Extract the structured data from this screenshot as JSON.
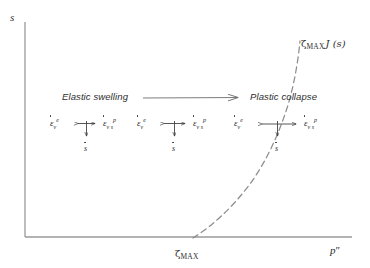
{
  "figure": {
    "type": "schematic-diagram",
    "background_color": "#ffffff",
    "ink_color": "#2e2e2e"
  },
  "axes": {
    "y_label": "s",
    "x_label": "p''",
    "x_label_base": "p",
    "x_label_primes": "″",
    "origin_px": [
      25,
      237
    ],
    "x_axis_end_px": [
      352,
      237
    ],
    "y_axis_top_px": [
      25,
      22
    ],
    "axis_color": "#9a9a9a"
  },
  "curve": {
    "name": "loading-collapse-yield-curve",
    "style": "dashed",
    "label_prefix": "ζ",
    "label_subscript": "MAX",
    "label_function": "J (s)",
    "label_full": "ζ MAX J (s)",
    "x_intercept_label_prefix": "ζ",
    "x_intercept_label_subscript": "MAX",
    "x_intercept_label_full": "ζ MAX",
    "dash_pattern": "6 4"
  },
  "captions": {
    "left": "Elastic swelling",
    "right": "Plastic collapse"
  },
  "direction_arrow": {
    "name": "elastic-to-plastic-arrow",
    "from_px": [
      143,
      98
    ],
    "to_px": [
      241,
      97
    ]
  },
  "rate_clusters": [
    {
      "id": "cluster-1",
      "left_symbol": {
        "base": "ε",
        "sub": "v",
        "sup": "e"
      },
      "right_symbol": {
        "base": "ε",
        "sub": "v s",
        "sup": "p"
      },
      "suction_symbol": "s",
      "arrow_style": "double-horizontal-short",
      "down_arrow": true
    },
    {
      "id": "cluster-2",
      "left_symbol": {
        "base": "ε",
        "sub": "v",
        "sup": "e"
      },
      "right_symbol": {
        "base": "ε",
        "sub": "v s",
        "sup": "p"
      },
      "suction_symbol": "s",
      "arrow_style": "double-horizontal-short",
      "down_arrow": true
    },
    {
      "id": "cluster-3",
      "left_symbol": {
        "base": "ε",
        "sub": "v",
        "sup": "e"
      },
      "right_symbol": {
        "base": "ε",
        "sub": "v s",
        "sup": "p"
      },
      "suction_symbol": "s",
      "arrow_style": "double-horizontal-long",
      "down_arrow": true
    }
  ]
}
